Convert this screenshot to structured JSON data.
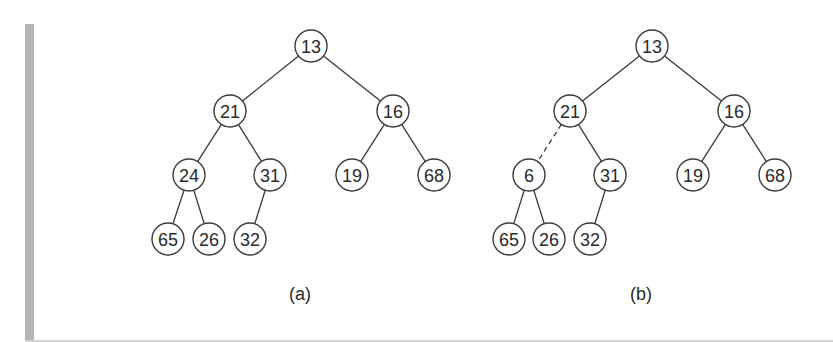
{
  "figure": {
    "node_radius": 16,
    "stroke_color": "#3a3a3a",
    "trees": [
      {
        "id": "a",
        "caption": "(a)",
        "caption_pos": [
          300,
          294
        ],
        "nodes": [
          {
            "label": "13",
            "x": 311,
            "y": 46
          },
          {
            "label": "21",
            "x": 230,
            "y": 111
          },
          {
            "label": "16",
            "x": 393,
            "y": 111
          },
          {
            "label": "24",
            "x": 189,
            "y": 175
          },
          {
            "label": "31",
            "x": 270,
            "y": 175
          },
          {
            "label": "19",
            "x": 352,
            "y": 175
          },
          {
            "label": "68",
            "x": 434,
            "y": 175
          },
          {
            "label": "65",
            "x": 168,
            "y": 239
          },
          {
            "label": "26",
            "x": 209,
            "y": 239
          },
          {
            "label": "32",
            "x": 250,
            "y": 239
          }
        ],
        "edges": [
          {
            "from": 0,
            "to": 1,
            "style": "solid"
          },
          {
            "from": 0,
            "to": 2,
            "style": "solid"
          },
          {
            "from": 1,
            "to": 3,
            "style": "solid"
          },
          {
            "from": 1,
            "to": 4,
            "style": "solid"
          },
          {
            "from": 2,
            "to": 5,
            "style": "solid"
          },
          {
            "from": 2,
            "to": 6,
            "style": "solid"
          },
          {
            "from": 3,
            "to": 7,
            "style": "solid"
          },
          {
            "from": 3,
            "to": 8,
            "style": "solid"
          },
          {
            "from": 4,
            "to": 9,
            "style": "solid"
          }
        ]
      },
      {
        "id": "b",
        "caption": "(b)",
        "caption_pos": [
          641,
          294
        ],
        "nodes": [
          {
            "label": "13",
            "x": 652,
            "y": 46
          },
          {
            "label": "21",
            "x": 570,
            "y": 111
          },
          {
            "label": "16",
            "x": 734,
            "y": 111
          },
          {
            "label": "6",
            "x": 529,
            "y": 175
          },
          {
            "label": "31",
            "x": 610,
            "y": 175
          },
          {
            "label": "19",
            "x": 693,
            "y": 175
          },
          {
            "label": "68",
            "x": 775,
            "y": 175
          },
          {
            "label": "65",
            "x": 509,
            "y": 239
          },
          {
            "label": "26",
            "x": 549,
            "y": 239
          },
          {
            "label": "32",
            "x": 590,
            "y": 239
          }
        ],
        "edges": [
          {
            "from": 0,
            "to": 1,
            "style": "solid"
          },
          {
            "from": 0,
            "to": 2,
            "style": "solid"
          },
          {
            "from": 1,
            "to": 3,
            "style": "dashed"
          },
          {
            "from": 1,
            "to": 4,
            "style": "solid"
          },
          {
            "from": 2,
            "to": 5,
            "style": "solid"
          },
          {
            "from": 2,
            "to": 6,
            "style": "solid"
          },
          {
            "from": 3,
            "to": 7,
            "style": "solid"
          },
          {
            "from": 3,
            "to": 8,
            "style": "solid"
          },
          {
            "from": 4,
            "to": 9,
            "style": "solid"
          }
        ]
      }
    ]
  }
}
